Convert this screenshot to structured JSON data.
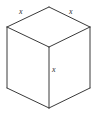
{
  "figure": {
    "kind": "line-drawing",
    "projection": "isometric",
    "width": 98,
    "height": 117,
    "background_color": "#ffffff",
    "stroke_color": "#3a3a3a",
    "stroke_width": 1,
    "label_color": "#2e2e2e"
  },
  "labels": {
    "top_left_edge": "x",
    "top_right_edge": "x",
    "vertical_edge": "x"
  },
  "vertices": {
    "top": [
      49,
      7
    ],
    "upper_left": [
      7,
      27
    ],
    "upper_right": [
      90,
      27
    ],
    "center": [
      49,
      47
    ],
    "lower_left": [
      7,
      88
    ],
    "lower_right": [
      90,
      88
    ],
    "bottom": [
      49,
      108
    ]
  },
  "edges": [
    {
      "name": "top-left-edge",
      "from": "upper_left",
      "to": "top"
    },
    {
      "name": "top-right-edge",
      "from": "top",
      "to": "upper_right"
    },
    {
      "name": "center-left-edge",
      "from": "upper_left",
      "to": "center"
    },
    {
      "name": "center-right-edge",
      "from": "center",
      "to": "upper_right"
    },
    {
      "name": "left-vertical-edge",
      "from": "upper_left",
      "to": "lower_left"
    },
    {
      "name": "right-vertical-edge",
      "from": "upper_right",
      "to": "lower_right"
    },
    {
      "name": "center-vertical-edge",
      "from": "center",
      "to": "bottom"
    },
    {
      "name": "bottom-left-edge",
      "from": "lower_left",
      "to": "bottom"
    },
    {
      "name": "bottom-right-edge",
      "from": "bottom",
      "to": "lower_right"
    }
  ]
}
